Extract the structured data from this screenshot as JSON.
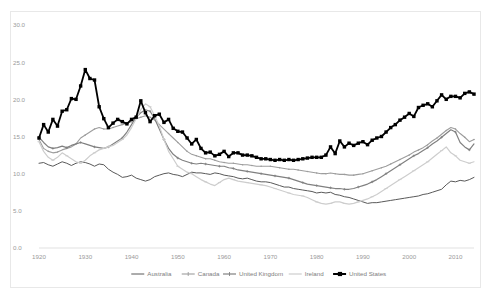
{
  "chart_data": {
    "type": "line",
    "title": "",
    "xlabel": "",
    "ylabel": "",
    "xlim": [
      1920,
      2014
    ],
    "ylim": [
      0.0,
      30.0
    ],
    "grid": false,
    "legend_position": "bottom",
    "ytick_labels": [
      "0.0",
      "5.0",
      "10.0",
      "15.0",
      "20.0",
      "25.0",
      "30.0"
    ],
    "ytick_values": [
      0.0,
      5.0,
      10.0,
      15.0,
      20.0,
      25.0,
      30.0
    ],
    "xtick_labels": [
      "1920",
      "1930",
      "1940",
      "1950",
      "1960",
      "1970",
      "1980",
      "1990",
      "2000",
      "2010"
    ],
    "xtick_values": [
      1920,
      1930,
      1940,
      1950,
      1960,
      1970,
      1980,
      1990,
      2000,
      2010
    ],
    "series": [
      {
        "name": "Australia",
        "color": "#595959",
        "width": 1.0,
        "marker": "none",
        "x": [
          1920,
          1921,
          1922,
          1923,
          1924,
          1925,
          1926,
          1927,
          1928,
          1929,
          1930,
          1931,
          1932,
          1933,
          1934,
          1935,
          1936,
          1937,
          1938,
          1939,
          1940,
          1941,
          1942,
          1943,
          1944,
          1945,
          1946,
          1947,
          1948,
          1949,
          1950,
          1951,
          1952,
          1953,
          1954,
          1955,
          1956,
          1957,
          1958,
          1959,
          1960,
          1961,
          1962,
          1963,
          1964,
          1965,
          1966,
          1967,
          1968,
          1969,
          1970,
          1971,
          1972,
          1973,
          1974,
          1975,
          1976,
          1977,
          1978,
          1979,
          1980,
          1981,
          1982,
          1983,
          1984,
          1985,
          1986,
          1987,
          1988,
          1989,
          1990,
          1991,
          1992,
          1993,
          1994,
          1995,
          1996,
          1997,
          1998,
          1999,
          2000,
          2001,
          2002,
          2003,
          2004,
          2005,
          2006,
          2007,
          2008,
          2009,
          2010,
          2011,
          2012,
          2013,
          2014
        ],
        "y": [
          11.4,
          11.5,
          11.2,
          11.0,
          11.3,
          11.6,
          11.4,
          11.1,
          11.4,
          11.6,
          11.5,
          11.3,
          11.0,
          11.3,
          11.2,
          10.6,
          10.2,
          9.9,
          9.5,
          9.6,
          9.8,
          9.4,
          9.2,
          9.0,
          9.2,
          9.6,
          9.8,
          10.0,
          10.1,
          9.9,
          9.8,
          9.6,
          9.9,
          10.2,
          10.1,
          10.1,
          10.0,
          9.9,
          10.1,
          10.0,
          9.8,
          9.7,
          9.6,
          9.4,
          9.3,
          9.4,
          9.2,
          9.0,
          8.9,
          8.9,
          8.8,
          8.6,
          8.4,
          8.2,
          8.2,
          8.0,
          7.9,
          7.8,
          7.7,
          7.6,
          7.4,
          7.5,
          7.4,
          7.5,
          7.2,
          7.1,
          6.9,
          6.8,
          6.6,
          6.4,
          6.2,
          6.0,
          6.1,
          6.1,
          6.2,
          6.3,
          6.4,
          6.5,
          6.6,
          6.7,
          6.8,
          6.9,
          7.0,
          7.2,
          7.3,
          7.5,
          7.7,
          7.9,
          8.5,
          9.0,
          8.9,
          9.1,
          9.0,
          9.2,
          9.5
        ]
      },
      {
        "name": "Canada",
        "color": "#9d9d9d",
        "width": 1.1,
        "marker": "dot",
        "x": [
          1920,
          1921,
          1922,
          1923,
          1924,
          1925,
          1926,
          1927,
          1928,
          1929,
          1930,
          1931,
          1932,
          1933,
          1934,
          1935,
          1936,
          1937,
          1938,
          1939,
          1940,
          1941,
          1942,
          1943,
          1944,
          1945,
          1946,
          1947,
          1948,
          1949,
          1950,
          1951,
          1952,
          1953,
          1954,
          1955,
          1956,
          1957,
          1958,
          1959,
          1960,
          1961,
          1962,
          1963,
          1964,
          1965,
          1966,
          1967,
          1968,
          1969,
          1970,
          1971,
          1972,
          1973,
          1974,
          1975,
          1976,
          1977,
          1978,
          1979,
          1980,
          1981,
          1982,
          1983,
          1984,
          1985,
          1986,
          1987,
          1988,
          1989,
          1990,
          1991,
          1992,
          1993,
          1994,
          1995,
          1996,
          1997,
          1998,
          1999,
          2000,
          2001,
          2002,
          2003,
          2004,
          2005,
          2006,
          2007,
          2008,
          2009,
          2010,
          2011,
          2012,
          2013,
          2014
        ],
        "y": [
          14.6,
          13.4,
          13.0,
          12.8,
          12.9,
          13.2,
          13.4,
          13.6,
          14.0,
          14.8,
          15.2,
          15.6,
          16.0,
          16.2,
          16.0,
          16.0,
          16.2,
          16.4,
          16.6,
          16.8,
          17.0,
          17.4,
          17.6,
          17.8,
          17.6,
          17.2,
          16.6,
          16.0,
          15.4,
          14.8,
          14.2,
          13.6,
          13.0,
          12.6,
          12.4,
          12.2,
          12.0,
          12.0,
          11.8,
          11.6,
          11.5,
          11.4,
          11.4,
          11.3,
          11.2,
          11.2,
          11.1,
          11.0,
          11.0,
          11.0,
          11.0,
          10.9,
          10.8,
          10.7,
          10.6,
          10.6,
          10.5,
          10.4,
          10.3,
          10.2,
          10.1,
          10.0,
          10.0,
          10.1,
          10.0,
          9.9,
          9.9,
          9.8,
          9.8,
          9.9,
          10.0,
          10.2,
          10.4,
          10.6,
          10.8,
          11.0,
          11.3,
          11.6,
          11.9,
          12.2,
          12.5,
          12.9,
          13.2,
          13.5,
          13.9,
          14.4,
          14.8,
          15.3,
          15.8,
          16.2,
          16.0,
          15.4,
          14.9,
          14.3,
          14.6
        ]
      },
      {
        "name": "United Kingdom",
        "color": "#808080",
        "width": 1.2,
        "marker": "plus",
        "x": [
          1920,
          1921,
          1922,
          1923,
          1924,
          1925,
          1926,
          1927,
          1928,
          1929,
          1930,
          1931,
          1932,
          1933,
          1934,
          1935,
          1936,
          1937,
          1938,
          1939,
          1940,
          1941,
          1942,
          1943,
          1944,
          1945,
          1946,
          1947,
          1948,
          1949,
          1950,
          1951,
          1952,
          1953,
          1954,
          1955,
          1956,
          1957,
          1958,
          1959,
          1960,
          1961,
          1962,
          1963,
          1964,
          1965,
          1966,
          1967,
          1968,
          1969,
          1970,
          1971,
          1972,
          1973,
          1974,
          1975,
          1976,
          1977,
          1978,
          1979,
          1980,
          1981,
          1982,
          1983,
          1984,
          1985,
          1986,
          1987,
          1988,
          1989,
          1990,
          1991,
          1992,
          1993,
          1994,
          1995,
          1996,
          1997,
          1998,
          1999,
          2000,
          2001,
          2002,
          2003,
          2004,
          2005,
          2006,
          2007,
          2008,
          2009,
          2010,
          2011,
          2012,
          2013,
          2014
        ],
        "y": [
          14.9,
          14.2,
          13.6,
          13.4,
          13.5,
          13.7,
          13.5,
          13.8,
          14.0,
          14.2,
          14.0,
          13.8,
          13.6,
          13.5,
          13.4,
          13.6,
          14.0,
          14.4,
          14.8,
          15.6,
          16.6,
          17.6,
          18.2,
          18.6,
          18.4,
          17.4,
          16.0,
          14.6,
          13.4,
          12.6,
          12.1,
          11.8,
          11.6,
          11.4,
          11.3,
          11.4,
          11.3,
          11.2,
          11.1,
          11.0,
          11.0,
          10.8,
          10.7,
          10.5,
          10.4,
          10.3,
          10.2,
          10.1,
          10.0,
          9.9,
          9.8,
          9.7,
          9.6,
          9.5,
          9.4,
          9.2,
          9.0,
          8.8,
          8.6,
          8.5,
          8.4,
          8.3,
          8.2,
          8.1,
          8.0,
          8.0,
          7.9,
          7.9,
          8.0,
          8.2,
          8.4,
          8.6,
          8.9,
          9.2,
          9.6,
          10.0,
          10.4,
          10.8,
          11.2,
          11.6,
          12.0,
          12.4,
          12.7,
          13.1,
          13.5,
          14.0,
          14.4,
          14.9,
          15.4,
          15.9,
          15.6,
          14.2,
          13.6,
          13.2,
          14.0
        ]
      },
      {
        "name": "Ireland",
        "color": "#cdcdcd",
        "width": 1.2,
        "marker": "dash",
        "x": [
          1920,
          1921,
          1922,
          1923,
          1924,
          1925,
          1926,
          1927,
          1928,
          1929,
          1930,
          1931,
          1932,
          1933,
          1934,
          1935,
          1936,
          1937,
          1938,
          1939,
          1940,
          1941,
          1942,
          1943,
          1944,
          1945,
          1946,
          1947,
          1948,
          1949,
          1950,
          1951,
          1952,
          1953,
          1954,
          1955,
          1956,
          1957,
          1958,
          1959,
          1960,
          1961,
          1962,
          1963,
          1964,
          1965,
          1966,
          1967,
          1968,
          1969,
          1970,
          1971,
          1972,
          1973,
          1974,
          1975,
          1976,
          1977,
          1978,
          1979,
          1980,
          1981,
          1982,
          1983,
          1984,
          1985,
          1986,
          1987,
          1988,
          1989,
          1990,
          1991,
          1992,
          1993,
          1994,
          1995,
          1996,
          1997,
          1998,
          1999,
          2000,
          2001,
          2002,
          2003,
          2004,
          2005,
          2006,
          2007,
          2008,
          2009,
          2010,
          2011,
          2012,
          2013,
          2014
        ],
        "y": [
          14.3,
          13.0,
          12.2,
          11.8,
          12.2,
          12.8,
          12.4,
          12.0,
          11.6,
          11.4,
          11.8,
          12.4,
          12.8,
          13.2,
          13.4,
          13.6,
          13.8,
          14.2,
          14.6,
          15.2,
          16.2,
          17.4,
          18.6,
          19.4,
          19.0,
          17.8,
          16.4,
          14.6,
          13.0,
          12.0,
          11.0,
          10.6,
          10.2,
          10.0,
          9.6,
          9.2,
          8.9,
          8.6,
          8.4,
          8.8,
          9.2,
          9.4,
          9.2,
          9.0,
          8.9,
          8.8,
          8.7,
          8.6,
          8.5,
          8.4,
          8.2,
          8.0,
          7.8,
          7.6,
          7.4,
          7.2,
          7.1,
          7.0,
          6.8,
          6.5,
          6.2,
          6.0,
          5.9,
          6.0,
          6.2,
          6.2,
          6.0,
          5.9,
          6.0,
          6.2,
          6.4,
          6.6,
          6.9,
          7.2,
          7.6,
          8.0,
          8.4,
          8.8,
          9.2,
          9.6,
          10.0,
          10.4,
          10.8,
          11.2,
          11.6,
          12.1,
          12.6,
          13.1,
          13.6,
          12.8,
          12.4,
          11.8,
          11.6,
          11.4,
          11.6
        ]
      },
      {
        "name": "United States",
        "color": "#000000",
        "width": 1.8,
        "marker": "square",
        "x": [
          1920,
          1921,
          1922,
          1923,
          1924,
          1925,
          1926,
          1927,
          1928,
          1929,
          1930,
          1931,
          1932,
          1933,
          1934,
          1935,
          1936,
          1937,
          1938,
          1939,
          1940,
          1941,
          1942,
          1943,
          1944,
          1945,
          1946,
          1947,
          1948,
          1949,
          1950,
          1951,
          1952,
          1953,
          1954,
          1955,
          1956,
          1957,
          1958,
          1959,
          1960,
          1961,
          1962,
          1963,
          1964,
          1965,
          1966,
          1967,
          1968,
          1969,
          1970,
          1971,
          1972,
          1973,
          1974,
          1975,
          1976,
          1977,
          1978,
          1979,
          1980,
          1981,
          1982,
          1983,
          1984,
          1985,
          1986,
          1987,
          1988,
          1989,
          1990,
          1991,
          1992,
          1993,
          1994,
          1995,
          1996,
          1997,
          1998,
          1999,
          2000,
          2001,
          2002,
          2003,
          2004,
          2005,
          2006,
          2007,
          2008,
          2009,
          2010,
          2011,
          2012,
          2013,
          2014
        ],
        "y": [
          14.8,
          16.6,
          15.6,
          17.3,
          16.4,
          18.4,
          18.6,
          20.1,
          20.0,
          21.8,
          24.0,
          22.8,
          22.6,
          19.0,
          17.4,
          16.2,
          16.8,
          17.3,
          17.0,
          16.7,
          17.3,
          17.6,
          19.8,
          18.2,
          17.0,
          17.8,
          18.0,
          16.9,
          17.3,
          16.1,
          15.7,
          15.6,
          14.8,
          14.0,
          14.6,
          13.4,
          12.8,
          12.9,
          12.4,
          12.6,
          13.0,
          12.3,
          12.8,
          12.8,
          12.5,
          12.5,
          12.4,
          12.2,
          12.0,
          12.0,
          11.9,
          11.8,
          11.9,
          11.8,
          11.9,
          11.8,
          11.9,
          12.0,
          12.1,
          12.2,
          12.2,
          12.2,
          12.5,
          13.6,
          12.7,
          14.4,
          13.6,
          14.1,
          13.8,
          14.1,
          14.3,
          13.9,
          14.5,
          14.8,
          15.0,
          15.6,
          16.2,
          16.6,
          17.2,
          17.6,
          18.1,
          17.7,
          18.9,
          19.2,
          19.4,
          19.0,
          19.8,
          20.6,
          20.0,
          20.4,
          20.4,
          20.2,
          20.8,
          21.0,
          20.7
        ]
      }
    ]
  }
}
